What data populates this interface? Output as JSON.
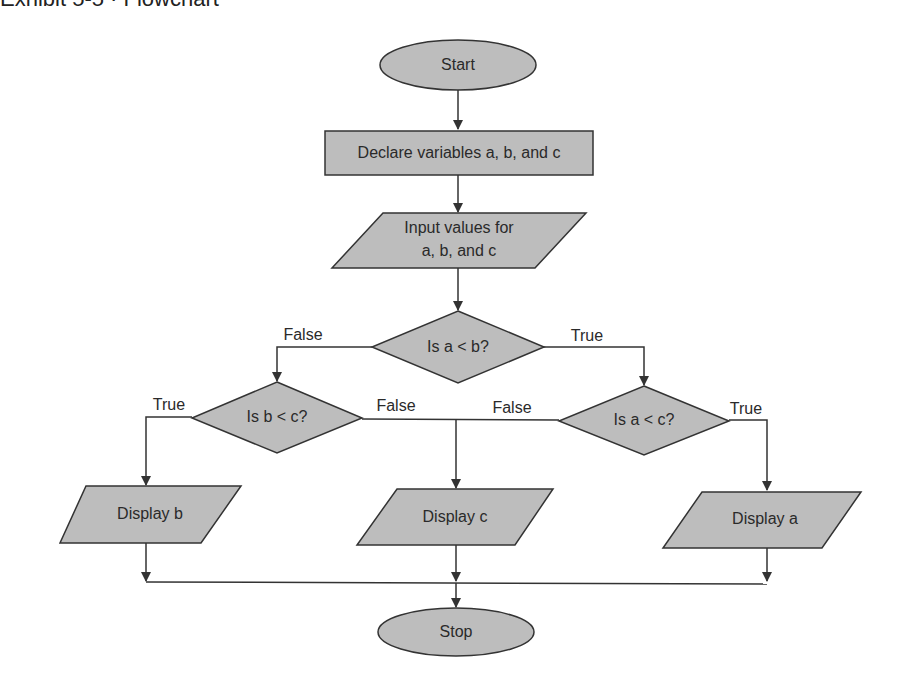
{
  "header": {
    "title_cut": "Exhibit 5-5 · Flowchart"
  },
  "nodes": {
    "start": {
      "label": "Start",
      "type": "terminator"
    },
    "declare": {
      "label": "Declare variables a, b, and c",
      "type": "process"
    },
    "input": {
      "label_line1": "Input values for",
      "label_line2": "a, b, and c",
      "type": "input-output"
    },
    "dec_a_lt_b": {
      "label": "Is a < b?",
      "type": "decision"
    },
    "dec_b_lt_c": {
      "label": "Is b < c?",
      "type": "decision"
    },
    "dec_a_lt_c": {
      "label": "Is a < c?",
      "type": "decision"
    },
    "display_b": {
      "label": "Display b",
      "type": "input-output"
    },
    "display_c": {
      "label": "Display c",
      "type": "input-output"
    },
    "display_a": {
      "label": "Display a",
      "type": "input-output"
    },
    "stop": {
      "label": "Stop",
      "type": "terminator"
    }
  },
  "edges": {
    "a_lt_b_false": "False",
    "a_lt_b_true": "True",
    "b_lt_c_true": "True",
    "b_lt_c_false": "False",
    "a_lt_c_false": "False",
    "a_lt_c_true": "True"
  },
  "colors": {
    "shape_fill": "#bdbdbd",
    "stroke": "#333333",
    "background": "#ffffff"
  }
}
